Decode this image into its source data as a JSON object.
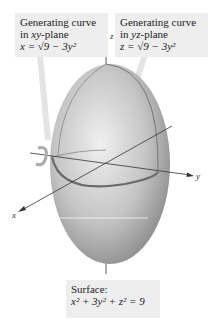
{
  "callouts": {
    "xy": {
      "line1": "Generating curve",
      "line2_pre": "in ",
      "line2_it": "xy",
      "line2_post": "-plane",
      "equation": "x = √9 − 3y²"
    },
    "yz": {
      "line1": "Generating curve",
      "line2_pre": "in ",
      "line2_it": "yz",
      "line2_post": "-plane",
      "equation": "z = √9 − 3y²"
    },
    "surface": {
      "line1": "Surface:",
      "equation": "x² + 3y² + z² = 9"
    }
  },
  "axes": {
    "x": "x",
    "y": "y",
    "z": "z"
  },
  "colors": {
    "ellipsoid_light": "#e6e6e6",
    "ellipsoid_dark": "#8a8a8a",
    "callout_bg": "#eeeeee",
    "curve": "#666666"
  }
}
